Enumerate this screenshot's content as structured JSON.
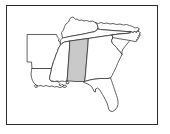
{
  "figure": {
    "caption": "",
    "frame": {
      "visible": true,
      "border_color": "#2b2b2b",
      "background_color": "#ffffff"
    },
    "highlight": {
      "state": "Alabama",
      "fill_color": "#c9c9c9",
      "outline_color": "#2d2d2d"
    },
    "default_state_fill": "#ffffff",
    "state_outline_color": "#2d2d2d"
  },
  "states": [
    {
      "id": "arkansas",
      "name": "Arkansas",
      "abbr": "AR",
      "highlighted": false
    },
    {
      "id": "louisiana",
      "name": "Louisiana",
      "abbr": "LA",
      "highlighted": false
    },
    {
      "id": "mississippi",
      "name": "Mississippi",
      "abbr": "MS",
      "highlighted": false
    },
    {
      "id": "alabama",
      "name": "Alabama",
      "abbr": "AL",
      "highlighted": true
    },
    {
      "id": "tennessee",
      "name": "Tennessee",
      "abbr": "TN",
      "highlighted": false
    },
    {
      "id": "kentucky",
      "name": "Kentucky",
      "abbr": "KY",
      "highlighted": false
    },
    {
      "id": "virginia",
      "name": "Virginia",
      "abbr": "VA",
      "highlighted": false
    },
    {
      "id": "north-carolina",
      "name": "North Carolina",
      "abbr": "NC",
      "highlighted": false
    },
    {
      "id": "south-carolina",
      "name": "South Carolina",
      "abbr": "SC",
      "highlighted": false
    },
    {
      "id": "georgia",
      "name": "Georgia",
      "abbr": "GA",
      "highlighted": false
    },
    {
      "id": "florida",
      "name": "Florida",
      "abbr": "FL",
      "highlighted": false
    }
  ]
}
